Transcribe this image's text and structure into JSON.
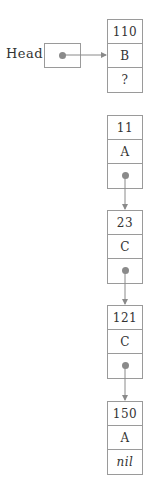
{
  "diagram": {
    "type": "linked-list",
    "head_label": "Head",
    "nodes": [
      {
        "key": "110",
        "value": "B",
        "next": "?"
      },
      {
        "key": "11",
        "value": "A",
        "next": "pointer"
      },
      {
        "key": "23",
        "value": "C",
        "next": "pointer"
      },
      {
        "key": "121",
        "value": "C",
        "next": "pointer"
      },
      {
        "key": "150",
        "value": "A",
        "next": "nil"
      }
    ],
    "colors": {
      "border": "#9a9a9a",
      "pointer": "#8a8a8a",
      "text": "#333333"
    }
  }
}
